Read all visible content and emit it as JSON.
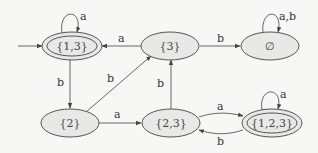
{
  "diagram": {
    "type": "finite-automaton",
    "colors": {
      "background": "#f7f7f5",
      "node_fill": "#e8e8e6",
      "stroke": "#555555"
    },
    "nodes": [
      {
        "id": "s13",
        "label": "{1,3}",
        "accepting": true,
        "initial": true
      },
      {
        "id": "s3",
        "label": "{3}",
        "accepting": false
      },
      {
        "id": "empty",
        "label": "∅",
        "accepting": false
      },
      {
        "id": "s2",
        "label": "{2}",
        "accepting": false
      },
      {
        "id": "s23",
        "label": "{2,3}",
        "accepting": false
      },
      {
        "id": "s123",
        "label": "{1,2,3}",
        "accepting": true
      }
    ],
    "edges": [
      {
        "from": "s13",
        "to": "s13",
        "label": "a"
      },
      {
        "from": "s3",
        "to": "s13",
        "label": "a"
      },
      {
        "from": "s3",
        "to": "empty",
        "label": "b"
      },
      {
        "from": "empty",
        "to": "empty",
        "label": "a,b"
      },
      {
        "from": "s13",
        "to": "s2",
        "label": "b"
      },
      {
        "from": "s2",
        "to": "s3",
        "label": "b"
      },
      {
        "from": "s2",
        "to": "s23",
        "label": "a"
      },
      {
        "from": "s23",
        "to": "s3",
        "label": "b"
      },
      {
        "from": "s23",
        "to": "s123",
        "label": "a"
      },
      {
        "from": "s123",
        "to": "s23",
        "label": "b"
      },
      {
        "from": "s123",
        "to": "s123",
        "label": "a"
      }
    ]
  }
}
